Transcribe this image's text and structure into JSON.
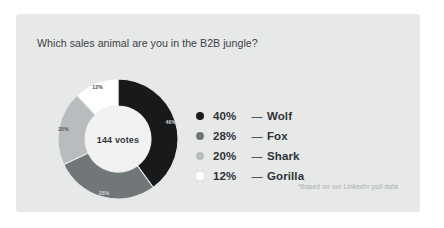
{
  "card": {
    "background_color": "#e7e8e8"
  },
  "poll": {
    "title": "Which sales animal are you in the B2B jungle?",
    "center_label": "144 votes",
    "footnote": "*Based on our LinkedIn poll data"
  },
  "chart_data": {
    "type": "pie",
    "variant": "donut",
    "title": "Which sales animal are you in the B2B jungle?",
    "center_text": "144 votes",
    "total_votes": 144,
    "unit": "%",
    "start_angle_deg": 0,
    "direction": "clockwise",
    "legend_position": "right",
    "grid": false,
    "categories": [
      "Wolf",
      "Fox",
      "Shark",
      "Gorilla"
    ],
    "values": [
      40,
      28,
      20,
      12
    ],
    "slice_labels": [
      "40%",
      "28%",
      "20%",
      "12%"
    ],
    "colors": [
      "#17191b",
      "#717679",
      "#b9bcbe",
      "#ffffff"
    ],
    "slice_label_colors": [
      "#d8d8d8",
      "#cfd1d2",
      "#55595c",
      "#4a4e51"
    ],
    "annotations": [
      "*Based on our LinkedIn poll data"
    ]
  },
  "legend": {
    "dash": "—",
    "items": [
      {
        "percent": "40%",
        "label": "Wolf",
        "color": "#17191b"
      },
      {
        "percent": "28%",
        "label": "Fox",
        "color": "#717679"
      },
      {
        "percent": "20%",
        "label": "Shark",
        "color": "#b9bcbe"
      },
      {
        "percent": "12%",
        "label": "Gorilla",
        "color": "#ffffff"
      }
    ]
  }
}
